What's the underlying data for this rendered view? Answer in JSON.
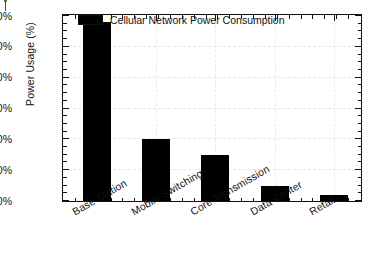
{
  "chart_data": {
    "type": "bar",
    "title": "",
    "subtitle": "",
    "xlabel": "",
    "ylabel": "Power Usage (%)",
    "categories": [
      "Base Station",
      "Mobile Switching",
      "Core Transmission",
      "Data Center",
      "Retail"
    ],
    "series": [
      {
        "name": "Cellular Network Power Consumption",
        "values": [
          58,
          20,
          15,
          5,
          2
        ],
        "color": "#000000"
      }
    ],
    "ylim": [
      0,
      60
    ],
    "ytick_values": [
      0,
      10,
      20,
      30,
      40,
      50,
      60
    ],
    "ytick_labels": [
      "0%",
      "10%",
      "20%",
      "30%",
      "40%",
      "50%",
      "60%"
    ],
    "y_minor_interval": 2.5,
    "grid": true,
    "grid_style": "dashed",
    "grid_color": "#e6e6e6",
    "legend_position": "top-left-inside",
    "axis_color": "#111111",
    "background_color": "#ffffff",
    "xtick_rotation_deg": -30
  },
  "legend": {
    "entries": [
      {
        "label": "Cellular Network Power Consumption",
        "swatch_color": "#000000"
      }
    ]
  },
  "axes": {
    "y_title": "Power Usage (%)"
  }
}
